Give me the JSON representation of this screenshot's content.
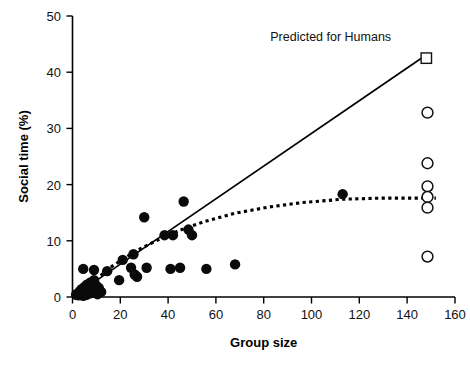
{
  "chart_data": {
    "type": "scatter",
    "title": "",
    "xlabel": "Group size",
    "ylabel": "Social time (%)",
    "xlim": [
      0,
      160
    ],
    "ylim": [
      0,
      50
    ],
    "xticks": [
      0,
      20,
      40,
      60,
      80,
      100,
      120,
      140,
      160
    ],
    "yticks": [
      0,
      10,
      20,
      30,
      40,
      50
    ],
    "grid": false,
    "legend_position": "none",
    "annotations": [
      {
        "text": "Predicted for Humans",
        "x": 108,
        "y": 45.5,
        "marker": "open-square",
        "marker_x": 148,
        "marker_y": 42.5
      }
    ],
    "series": [
      {
        "name": "Primate groups (filled circles)",
        "marker": "filled-circle",
        "points": [
          [
            1.5,
            0.4
          ],
          [
            2.0,
            0.6
          ],
          [
            2.5,
            0.3
          ],
          [
            3.0,
            1.0
          ],
          [
            3.2,
            0.5
          ],
          [
            3.8,
            1.4
          ],
          [
            4.0,
            0.8
          ],
          [
            4.5,
            0.2
          ],
          [
            5.0,
            1.8
          ],
          [
            5.2,
            0.9
          ],
          [
            5.8,
            0.4
          ],
          [
            6.0,
            2.2
          ],
          [
            6.5,
            1.2
          ],
          [
            7.0,
            0.6
          ],
          [
            7.5,
            2.6
          ],
          [
            8.0,
            1.5
          ],
          [
            8.5,
            0.8
          ],
          [
            9.0,
            3.0
          ],
          [
            9.5,
            1.0
          ],
          [
            10.0,
            2.0
          ],
          [
            10.5,
            0.5
          ],
          [
            11.0,
            1.6
          ],
          [
            12.0,
            0.9
          ],
          [
            4.5,
            5.0
          ],
          [
            9.0,
            4.8
          ],
          [
            14.5,
            4.6
          ],
          [
            19.5,
            3.0
          ],
          [
            21.0,
            6.6
          ],
          [
            24.5,
            5.2
          ],
          [
            25.5,
            7.6
          ],
          [
            26.0,
            4.0
          ],
          [
            27.0,
            3.6
          ],
          [
            30.0,
            14.2
          ],
          [
            31.0,
            5.2
          ],
          [
            38.5,
            11.0
          ],
          [
            41.0,
            5.0
          ],
          [
            42.0,
            11.0
          ],
          [
            45.0,
            5.2
          ],
          [
            46.5,
            17.0
          ],
          [
            48.5,
            12.0
          ],
          [
            50.0,
            11.0
          ],
          [
            56.0,
            5.0
          ],
          [
            68.0,
            5.8
          ],
          [
            113.0,
            18.3
          ]
        ]
      },
      {
        "name": "Human groups (open circles)",
        "marker": "open-circle",
        "points": [
          [
            148.5,
            32.8
          ],
          [
            148.5,
            23.8
          ],
          [
            148.5,
            19.7
          ],
          [
            148.5,
            17.8
          ],
          [
            148.5,
            15.9
          ],
          [
            148.5,
            7.2
          ]
        ]
      }
    ],
    "lines": [
      {
        "name": "Linear regression (solid)",
        "style": "solid",
        "points": [
          [
            2.0,
            0.6
          ],
          [
            147.0,
            42.8
          ]
        ]
      },
      {
        "name": "Asymptotic fit (dotted)",
        "style": "dotted",
        "points": [
          [
            4.0,
            0.5
          ],
          [
            10.0,
            3.2
          ],
          [
            16.0,
            5.3
          ],
          [
            22.0,
            7.0
          ],
          [
            28.0,
            8.5
          ],
          [
            36.0,
            10.2
          ],
          [
            45.0,
            11.9
          ],
          [
            55.0,
            13.4
          ],
          [
            68.0,
            14.9
          ],
          [
            82.0,
            16.0
          ],
          [
            96.0,
            16.8
          ],
          [
            113.0,
            17.4
          ],
          [
            130.0,
            17.6
          ],
          [
            152.0,
            17.6
          ]
        ]
      }
    ]
  },
  "axes": {
    "x_tick_labels": [
      "0",
      "20",
      "40",
      "60",
      "80",
      "100",
      "120",
      "140",
      "160"
    ],
    "y_tick_labels": [
      "0",
      "10",
      "20",
      "30",
      "40",
      "50"
    ],
    "x_title": "Group size",
    "y_title": "Social time (%)"
  },
  "annotation_text": "Predicted for Humans"
}
